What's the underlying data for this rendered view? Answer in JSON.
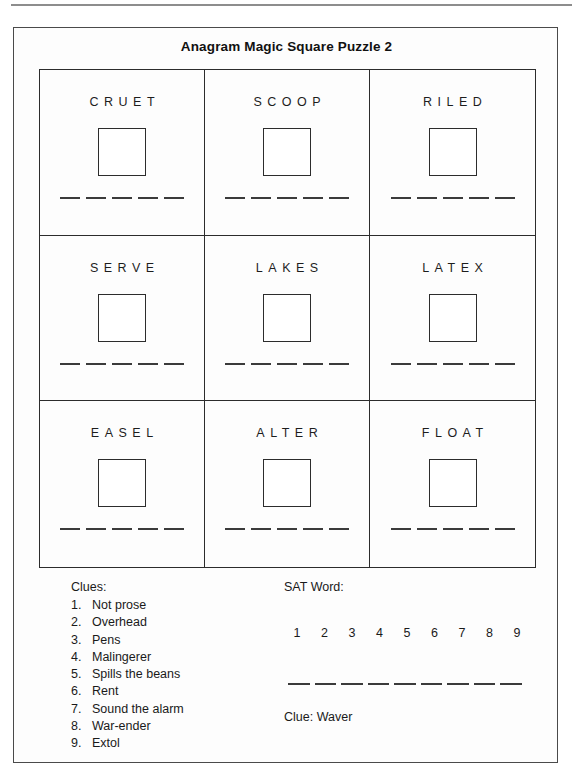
{
  "page": {
    "title": "Anagram Magic Square Puzzle 2"
  },
  "grid": {
    "cells": [
      {
        "word": "CRUET",
        "letters": 5,
        "box_value": ""
      },
      {
        "word": "SCOOP",
        "letters": 5,
        "box_value": ""
      },
      {
        "word": "RILED",
        "letters": 5,
        "box_value": ""
      },
      {
        "word": "SERVE",
        "letters": 5,
        "box_value": ""
      },
      {
        "word": "LAKES",
        "letters": 5,
        "box_value": ""
      },
      {
        "word": "LATEX",
        "letters": 5,
        "box_value": ""
      },
      {
        "word": "EASEL",
        "letters": 5,
        "box_value": ""
      },
      {
        "word": "ALTER",
        "letters": 5,
        "box_value": ""
      },
      {
        "word": "FLOAT",
        "letters": 5,
        "box_value": ""
      }
    ]
  },
  "clues": {
    "heading": "Clues:",
    "items": [
      {
        "num": "1.",
        "text": "Not prose"
      },
      {
        "num": "2.",
        "text": "Overhead"
      },
      {
        "num": "3.",
        "text": "Pens"
      },
      {
        "num": "4.",
        "text": "Malingerer"
      },
      {
        "num": "5.",
        "text": "Spills the beans"
      },
      {
        "num": "6.",
        "text": "Rent"
      },
      {
        "num": "7.",
        "text": "Sound the alarm"
      },
      {
        "num": "8.",
        "text": "War-ender"
      },
      {
        "num": "9.",
        "text": "Extol"
      }
    ]
  },
  "sat_word": {
    "heading": "SAT Word:",
    "numbers": [
      "1",
      "2",
      "3",
      "4",
      "5",
      "6",
      "7",
      "8",
      "9"
    ],
    "blank_count": 9,
    "clue": "Clue: Waver"
  },
  "colors": {
    "ink": "#1a1a1a",
    "rule": "#8d8d8d",
    "border": "#2c2c2c",
    "paper": "#fdfdfd"
  }
}
